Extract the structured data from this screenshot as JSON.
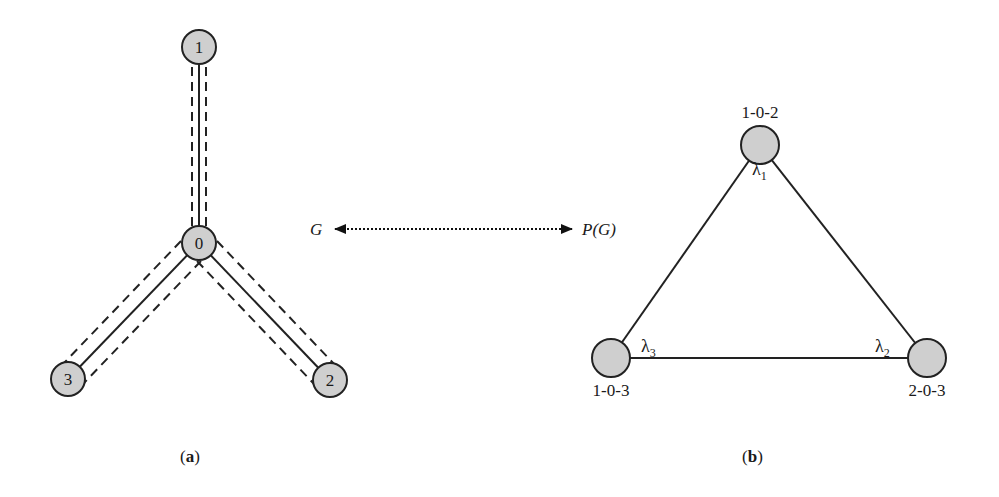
{
  "diagram_a": {
    "caption": "(a)",
    "nodes": [
      {
        "id": "1",
        "label": "1",
        "x": 199,
        "y": 47
      },
      {
        "id": "0",
        "label": "0",
        "x": 199,
        "y": 243
      },
      {
        "id": "3",
        "label": "3",
        "x": 68,
        "y": 379
      },
      {
        "id": "2",
        "label": "2",
        "x": 330,
        "y": 380
      }
    ],
    "edges": [
      {
        "from": "0",
        "to": "1",
        "style": "solid-with-dashed-parallels"
      },
      {
        "from": "0",
        "to": "3",
        "style": "solid-with-dashed-parallels"
      },
      {
        "from": "0",
        "to": "2",
        "style": "solid-with-dashed-parallels"
      }
    ]
  },
  "mapping": {
    "left_label": "G",
    "right_label": "P(G)",
    "style": "dotted double-headed arrow"
  },
  "diagram_b": {
    "caption": "(b)",
    "nodes": [
      {
        "id": "102",
        "label": "1-0-2",
        "weight": "λ",
        "sub": "1",
        "x": 760,
        "y": 145
      },
      {
        "id": "203",
        "label": "2-0-3",
        "weight": "λ",
        "sub": "2",
        "x": 927,
        "y": 358
      },
      {
        "id": "103",
        "label": "1-0-3",
        "weight": "λ",
        "sub": "3",
        "x": 611,
        "y": 358
      }
    ],
    "edges": [
      {
        "from": "102",
        "to": "203"
      },
      {
        "from": "203",
        "to": "103"
      },
      {
        "from": "103",
        "to": "102"
      }
    ]
  }
}
